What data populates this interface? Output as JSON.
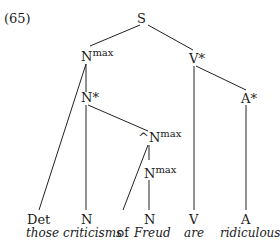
{
  "example_number": "(65)",
  "nodes": {
    "S": "S",
    "Nmax_top_base": "N",
    "Nmax_top_sup": "max",
    "Vstar": "V*",
    "Nstar": "N*",
    "Astar": "A*",
    "Nmax_hat_base": "^N",
    "Nmax_hat_sup": "max",
    "Nmax_low_base": "N",
    "Nmax_low_sup": "max"
  },
  "leaves": [
    {
      "category": "Det",
      "word": "those"
    },
    {
      "category": "N",
      "word": "criticisms"
    },
    {
      "category": "",
      "word": "of"
    },
    {
      "category": "N",
      "word": "Freud"
    },
    {
      "category": "V",
      "word": "are"
    },
    {
      "category": "A",
      "word": "ridiculous"
    }
  ]
}
